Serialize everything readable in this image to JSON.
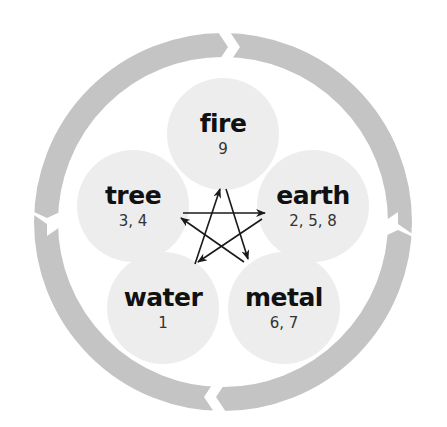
{
  "diagram": {
    "colors": {
      "ring": "#c4c4c4",
      "circle": "#ededed",
      "arrow": "#1a1a1a",
      "text": "#111111"
    },
    "cycle_direction": "clockwise",
    "elements": [
      {
        "id": "fire",
        "name": "fire",
        "numbers": "9"
      },
      {
        "id": "earth",
        "name": "earth",
        "numbers": "2, 5, 8"
      },
      {
        "id": "metal",
        "name": "metal",
        "numbers": "6, 7"
      },
      {
        "id": "water",
        "name": "water",
        "numbers": "1"
      },
      {
        "id": "tree",
        "name": "tree",
        "numbers": "3, 4"
      }
    ],
    "star_arrows": [
      {
        "from": "water-pos",
        "to": "fire-pos"
      },
      {
        "from": "fire-pos",
        "to": "metal-pos"
      },
      {
        "from": "tree-pos",
        "to": "earth-pos"
      },
      {
        "from": "earth-pos",
        "to": "water-pos"
      },
      {
        "from": "metal-pos",
        "to": "tree-pos"
      }
    ]
  }
}
